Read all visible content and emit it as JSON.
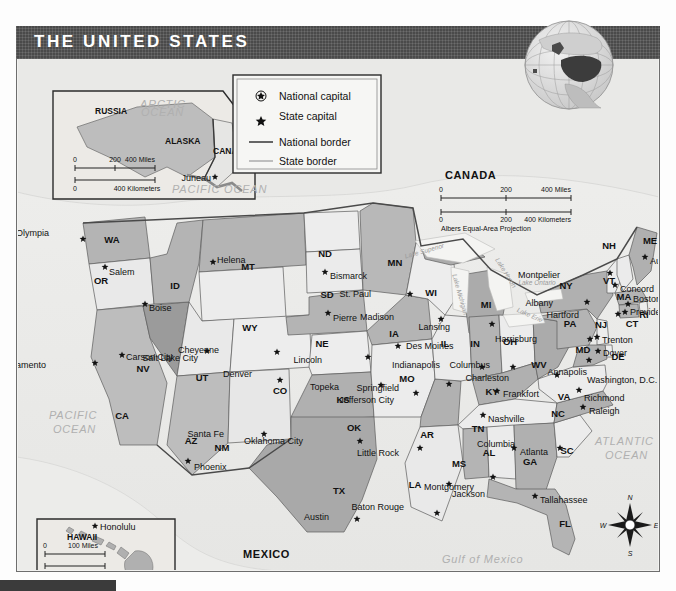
{
  "title": "THE UNITED STATES",
  "legend": {
    "items": [
      {
        "icon": "national-capital-star-circle",
        "label": "National capital"
      },
      {
        "icon": "state-capital-star",
        "label": "State capital"
      },
      {
        "icon": "national-border-line",
        "label": "National border"
      },
      {
        "icon": "state-border-line",
        "label": "State border"
      }
    ]
  },
  "main_scale": {
    "miles_ticks": [
      "0",
      "200",
      "400 Miles"
    ],
    "km_ticks": [
      "0",
      "200",
      "400 Kilometers"
    ],
    "projection": "Albers Equal-Area Projection"
  },
  "countries": [
    {
      "name": "CANADA",
      "x": 428,
      "y": 152
    },
    {
      "name": "MEXICO",
      "x": 226,
      "y": 531
    }
  ],
  "oceans": [
    {
      "name": "PACIFIC",
      "x": 32,
      "y": 392
    },
    {
      "name": "OCEAN",
      "x": 36,
      "y": 406
    },
    {
      "name": "ATLANTIC",
      "x": 578,
      "y": 418
    },
    {
      "name": "OCEAN",
      "x": 588,
      "y": 432
    },
    {
      "name": "Gulf of Mexico",
      "x": 425,
      "y": 536
    }
  ],
  "lakes": [
    {
      "name": "Lake Superior",
      "x": 408,
      "y": 226,
      "rot": -16
    },
    {
      "name": "Lake Michigan",
      "x": 441,
      "y": 268,
      "rot": 74
    },
    {
      "name": "Lake Huron",
      "x": 487,
      "y": 247,
      "rot": 58
    },
    {
      "name": "Lake Erie",
      "x": 512,
      "y": 290,
      "rot": 24
    },
    {
      "name": "Lake Ontario",
      "x": 520,
      "y": 258,
      "rot": 0
    }
  ],
  "alaska_inset": {
    "labels": [
      {
        "name": "RUSSIA",
        "x": 78,
        "y": 87
      },
      {
        "name": "ALASKA",
        "x": 148,
        "y": 117
      },
      {
        "name": "CANADA",
        "x": 196,
        "y": 127
      },
      {
        "name": "ARCTIC",
        "x": 123,
        "y": 81
      },
      {
        "name": "OCEAN",
        "x": 124,
        "y": 89
      },
      {
        "name": "PACIFIC OCEAN",
        "x": 155,
        "y": 166
      }
    ],
    "capital": {
      "name": "Juneau",
      "x": 172,
      "y": 152
    },
    "scale": {
      "miles": [
        "0",
        "200",
        "400 Miles"
      ],
      "km": [
        "0",
        "400 Kilometers"
      ]
    }
  },
  "hawaii_inset": {
    "labels": [
      {
        "name": "HAWAII",
        "x": 50,
        "y": 513
      },
      {
        "name": "PACIFIC OCEAN",
        "x": 46,
        "y": 551
      }
    ],
    "capital": {
      "name": "Honolulu",
      "x": 83,
      "y": 503
    },
    "scale": {
      "miles": [
        "0",
        "100 Miles"
      ],
      "km": [
        "0",
        "100 Kilometers"
      ]
    }
  },
  "compass": {
    "n": "N",
    "e": "E",
    "s": "S",
    "w": "W"
  },
  "states": [
    {
      "abbr": "WA",
      "ax": 95,
      "ay": 216,
      "capital": "Olympia",
      "cx": 76,
      "cy": 202,
      "sx": 66,
      "sy": 212,
      "lx": -34,
      "ly": -6,
      "fill": "mid"
    },
    {
      "abbr": "OR",
      "ax": 84,
      "ay": 257,
      "capital": "Salem",
      "cx": 99,
      "cy": 244,
      "sx": 88,
      "sy": 240,
      "lx": 4,
      "ly": 5,
      "fill": "light"
    },
    {
      "abbr": "ID",
      "ax": 158,
      "ay": 262,
      "capital": "Boise",
      "cx": 138,
      "cy": 280,
      "sx": 128,
      "sy": 277,
      "lx": 4,
      "ly": 4,
      "fill": "mid"
    },
    {
      "abbr": "MT",
      "ax": 231,
      "ay": 243,
      "capital": "Helena",
      "cx": 216,
      "cy": 232,
      "sx": 196,
      "sy": 235,
      "lx": 4,
      "ly": -2,
      "fill": "mid"
    },
    {
      "abbr": "ND",
      "ax": 308,
      "ay": 230,
      "capital": "Bismarck",
      "cx": 319,
      "cy": 248,
      "sx": 308,
      "sy": 245,
      "lx": 5,
      "ly": 4,
      "fill": "light"
    },
    {
      "abbr": "SD",
      "ax": 310,
      "ay": 271,
      "capital": "Pierre",
      "cx": 321,
      "cy": 290,
      "sx": 311,
      "sy": 286,
      "lx": 5,
      "ly": 5,
      "fill": "light"
    },
    {
      "abbr": "NE",
      "ax": 305,
      "ay": 320,
      "capital": "Lincoln",
      "cx": 330,
      "cy": 332,
      "sx": 351,
      "sy": 330,
      "lx": -46,
      "ly": 3,
      "fill": "mid"
    },
    {
      "abbr": "KS",
      "ax": 326,
      "ay": 376,
      "capital": "Topeka",
      "cx": 341,
      "cy": 357,
      "sx": 364,
      "sy": 358,
      "lx": -42,
      "ly": 2,
      "fill": "light"
    },
    {
      "abbr": "MN",
      "ax": 378,
      "ay": 239,
      "capital": "St. Paul",
      "cx": 369,
      "cy": 264,
      "sx": 393,
      "sy": 267,
      "lx": -39,
      "ly": 0,
      "fill": "mid"
    },
    {
      "abbr": "WI",
      "ax": 414,
      "ay": 269,
      "capital": "Madison",
      "cx": 411,
      "cy": 285,
      "sx": 424,
      "sy": 292,
      "lx": -47,
      "ly": -2,
      "fill": "light"
    },
    {
      "abbr": "IA",
      "ax": 377,
      "ay": 310,
      "capital": "Des Moines",
      "cx": 385,
      "cy": 311,
      "sx": 381,
      "sy": 319,
      "lx": 8,
      "ly": 0,
      "fill": "mid"
    },
    {
      "abbr": "MO",
      "ax": 390,
      "ay": 355,
      "capital": "Jefferson City",
      "cx": 385,
      "cy": 371,
      "sx": 399,
      "sy": 366,
      "lx": -22,
      "ly": 7,
      "fill": "light"
    },
    {
      "abbr": "IL",
      "ax": 428,
      "ay": 320,
      "capital": "Springfield",
      "cx": 418,
      "cy": 362,
      "sx": 432,
      "sy": 357,
      "lx": -50,
      "ly": 4,
      "fill": "light"
    },
    {
      "abbr": "MI",
      "ax": 469,
      "ay": 281,
      "capital": "Lansing",
      "cx": 461,
      "cy": 300,
      "sx": 475,
      "sy": 297,
      "lx": -42,
      "ly": 3,
      "fill": "mid"
    },
    {
      "abbr": "IN",
      "ax": 458,
      "ay": 320,
      "capital": "Indianapolis",
      "cx": 450,
      "cy": 331,
      "sx": 465,
      "sy": 340,
      "lx": -42,
      "ly": -2,
      "fill": "mid"
    },
    {
      "abbr": "OH",
      "ax": 493,
      "ay": 318,
      "capital": "Columbus",
      "cx": 495,
      "cy": 328,
      "sx": 496,
      "sy": 340,
      "lx": -23,
      "ly": -2,
      "fill": "light"
    },
    {
      "abbr": "KY",
      "ax": 475,
      "ay": 368,
      "capital": "Frankfort",
      "cx": 490,
      "cy": 360,
      "sx": 480,
      "sy": 364,
      "lx": 6,
      "ly": 3,
      "fill": "mid"
    },
    {
      "abbr": "TN",
      "ax": 461,
      "ay": 405,
      "capital": "Nashville",
      "cx": 480,
      "cy": 391,
      "sx": 466,
      "sy": 388,
      "lx": 5,
      "ly": 4,
      "fill": "light"
    },
    {
      "abbr": "WV",
      "ax": 522,
      "ay": 341,
      "capital": "Charleston",
      "cx": 529,
      "cy": 351,
      "sx": 540,
      "sy": 348,
      "lx": -48,
      "ly": 3,
      "fill": "mid"
    },
    {
      "abbr": "VA",
      "ax": 547,
      "ay": 373,
      "capital": "Richmond",
      "cx": 575,
      "cy": 370,
      "sx": 562,
      "sy": 363,
      "lx": 5,
      "ly": 8,
      "fill": "light"
    },
    {
      "abbr": "NC",
      "ax": 541,
      "ay": 390,
      "capital": "Raleigh",
      "cx": 578,
      "cy": 383,
      "sx": 566,
      "sy": 380,
      "lx": 6,
      "ly": 4,
      "fill": "mid"
    },
    {
      "abbr": "SC",
      "ax": 550,
      "ay": 427,
      "capital": "Columbia",
      "cx": 531,
      "cy": 413,
      "sx": 543,
      "sy": 421,
      "lx": -45,
      "ly": -4,
      "fill": "light"
    },
    {
      "abbr": "GA",
      "ax": 513,
      "ay": 438,
      "capital": "Atlanta",
      "cx": 505,
      "cy": 424,
      "sx": 497,
      "sy": 421,
      "lx": 6,
      "ly": 4,
      "fill": "mid"
    },
    {
      "abbr": "FL",
      "ax": 548,
      "ay": 500,
      "capital": "Tallahassee",
      "cx": 530,
      "cy": 472,
      "sx": 518,
      "sy": 469,
      "lx": 5,
      "ly": 4,
      "fill": "mid"
    },
    {
      "abbr": "AL",
      "ax": 472,
      "ay": 429,
      "capital": "Montgomery",
      "cx": 479,
      "cy": 459,
      "sx": 476,
      "sy": 450,
      "lx": -19,
      "ly": 10,
      "fill": "light"
    },
    {
      "abbr": "MS",
      "ax": 442,
      "ay": 440,
      "capital": "Jackson",
      "cx": 445,
      "cy": 464,
      "sx": 432,
      "sy": 457,
      "lx": 3,
      "ly": 10,
      "fill": "mid"
    },
    {
      "abbr": "LA",
      "ax": 398,
      "ay": 461,
      "capital": "Baton Rouge",
      "cx": 399,
      "cy": 478,
      "sx": 420,
      "sy": 486,
      "lx": -33,
      "ly": -6,
      "fill": "light"
    },
    {
      "abbr": "AR",
      "ax": 410,
      "ay": 411,
      "capital": "Little Rock",
      "cx": 389,
      "cy": 425,
      "sx": 403,
      "sy": 421,
      "lx": -21,
      "ly": 5,
      "fill": "mid"
    },
    {
      "abbr": "OK",
      "ax": 337,
      "ay": 404,
      "capital": "Oklahoma City",
      "cx": 310,
      "cy": 415,
      "sx": 343,
      "sy": 414,
      "lx": -57,
      "ly": 0,
      "fill": "mid"
    },
    {
      "abbr": "TX",
      "ax": 322,
      "ay": 467,
      "capital": "Austin",
      "cx": 323,
      "cy": 487,
      "sx": 340,
      "sy": 492,
      "lx": -28,
      "ly": -2,
      "fill": "mid"
    },
    {
      "abbr": "NM",
      "ax": 205,
      "ay": 424,
      "capital": "Santa Fe",
      "cx": 228,
      "cy": 404,
      "sx": 247,
      "sy": 407,
      "lx": -40,
      "ly": 0,
      "fill": "light"
    },
    {
      "abbr": "AZ",
      "ax": 174,
      "ay": 417,
      "capital": "Phoenix",
      "cx": 191,
      "cy": 440,
      "sx": 171,
      "sy": 434,
      "lx": 6,
      "ly": 6,
      "fill": "mid"
    },
    {
      "abbr": "UT",
      "ax": 185,
      "ay": 354,
      "capital": "Salt Lake City",
      "cx": 182,
      "cy": 332,
      "sx": 190,
      "sy": 324,
      "lx": -9,
      "ly": 7,
      "fill": "light"
    },
    {
      "abbr": "NV",
      "ax": 126,
      "ay": 345,
      "capital": "Carson City",
      "cx": 115,
      "cy": 328,
      "sx": 105,
      "sy": 328,
      "lx": 4,
      "ly": 2,
      "fill": "dark"
    },
    {
      "abbr": "CA",
      "ax": 105,
      "ay": 392,
      "capital": "Sacramento",
      "cx": 31,
      "cy": 331,
      "sx": 78,
      "sy": 336,
      "lx": -49,
      "ly": 2,
      "fill": "mid"
    },
    {
      "abbr": "CO",
      "ax": 263,
      "ay": 367,
      "capital": "Denver",
      "cx": 236,
      "cy": 344,
      "sx": 263,
      "sy": 353,
      "lx": -28,
      "ly": -6,
      "fill": "light"
    },
    {
      "abbr": "WY",
      "ax": 233,
      "ay": 304,
      "capital": "Cheyenne",
      "cx": 225,
      "cy": 321,
      "sx": 260,
      "sy": 325,
      "lx": -58,
      "ly": -2,
      "fill": "light"
    },
    {
      "abbr": "PA",
      "ax": 553,
      "ay": 300,
      "capital": "Harrisburg",
      "cx": 536,
      "cy": 310,
      "sx": 573,
      "sy": 312,
      "lx": -53,
      "ly": 0,
      "fill": "mid"
    },
    {
      "abbr": "NY",
      "ax": 549,
      "ay": 262,
      "capital": "Albany",
      "cx": 542,
      "cy": 276,
      "sx": 570,
      "sy": 275,
      "lx": -34,
      "ly": 1,
      "fill": "mid"
    },
    {
      "abbr": "VT",
      "ax": 592,
      "ay": 257,
      "capital": "Montpelier",
      "cx": 544,
      "cy": 247,
      "sx": 593,
      "sy": 246,
      "lx": -50,
      "ly": 2,
      "fill": "light"
    },
    {
      "abbr": "NH",
      "ax": 592,
      "ay": 222,
      "capital": "Concord",
      "cx": 604,
      "cy": 262,
      "sx": 598,
      "sy": 258,
      "lx": 5,
      "ly": 4,
      "fill": "light"
    },
    {
      "abbr": "ME",
      "ax": 633,
      "ay": 217,
      "capital": "Augusta",
      "cx": 638,
      "cy": 233,
      "sx": 628,
      "sy": 230,
      "lx": 5,
      "ly": 4,
      "fill": "mid"
    },
    {
      "abbr": "MA",
      "ax": 607,
      "ay": 273,
      "capital": "Boston",
      "cx": 617,
      "cy": 270,
      "sx": 611,
      "sy": 277,
      "lx": 5,
      "ly": -5,
      "fill": "mid"
    },
    {
      "abbr": "RI",
      "ax": 627,
      "ay": 291,
      "capital": "Providence",
      "cx": 612,
      "cy": 285,
      "sx": 608,
      "sy": 285,
      "lx": 5,
      "ly": 0,
      "fill": "light"
    },
    {
      "abbr": "CT",
      "ax": 615,
      "ay": 300,
      "capital": "Hartford",
      "cx": 566,
      "cy": 287,
      "sx": 601,
      "sy": 287,
      "lx": -39,
      "ly": 1,
      "fill": "mid"
    },
    {
      "abbr": "NJ",
      "ax": 584,
      "ay": 301,
      "capital": "Trenton",
      "cx": 587,
      "cy": 312,
      "sx": 580,
      "sy": 310,
      "lx": 5,
      "ly": 3,
      "fill": "light"
    },
    {
      "abbr": "DE",
      "ax": 601,
      "ay": 333,
      "capital": "Dover",
      "cx": 589,
      "cy": 325,
      "sx": 581,
      "sy": 324,
      "lx": 5,
      "ly": 2,
      "fill": "light"
    },
    {
      "abbr": "MD",
      "ax": 566,
      "ay": 326,
      "capital": "Annapolis",
      "cx": 576,
      "cy": 344,
      "sx": 572,
      "sy": 333,
      "lx": -2,
      "ly": 12,
      "fill": "mid"
    }
  ],
  "extra_labels": [
    {
      "name": "Washington, D.C.",
      "x": 570,
      "y": 356
    }
  ]
}
